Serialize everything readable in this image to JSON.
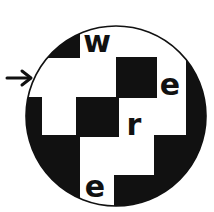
{
  "puzzle": {
    "letters": [
      {
        "id": "w",
        "char": "w",
        "x": 97,
        "y": 52
      },
      {
        "id": "e1",
        "char": "e",
        "x": 170,
        "y": 95
      },
      {
        "id": "r",
        "char": "r",
        "x": 134,
        "y": 135
      },
      {
        "id": "e2",
        "char": "e",
        "x": 95,
        "y": 197
      }
    ],
    "arrow": {
      "glyph": "→",
      "direction": "right"
    },
    "colors": {
      "ink": "#111111",
      "paper": "#ffffff"
    }
  }
}
